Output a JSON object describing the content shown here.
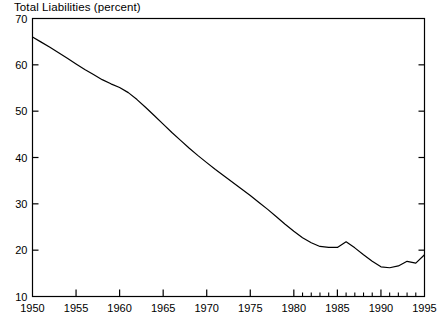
{
  "chart_data": {
    "type": "line",
    "title": "Total Liabilities (percent)",
    "xlabel": "",
    "ylabel": "",
    "xlim": [
      1950,
      1995
    ],
    "ylim": [
      10,
      70
    ],
    "grid": false,
    "legend": null,
    "yticks": [
      10,
      20,
      30,
      40,
      50,
      60,
      70
    ],
    "ytick_labels": [
      "10",
      "20",
      "30",
      "40",
      "50",
      "60",
      "70"
    ],
    "xticks": [
      1950,
      1955,
      1960,
      1965,
      1970,
      1975,
      1980,
      1985,
      1990,
      1995
    ],
    "xtick_labels": [
      "1950",
      "1955",
      "1960",
      "1965",
      "1970",
      "1975",
      "1980",
      "1985",
      "1990",
      "1995"
    ],
    "minor_xticks": [
      1981,
      1982,
      1983,
      1984,
      1986,
      1987,
      1988,
      1989,
      1991,
      1992,
      1993,
      1994
    ],
    "minor_ytick_side": "right",
    "line_color": "#000000",
    "line_width": 1.2,
    "series": [
      {
        "name": "Total Liabilities",
        "x": [
          1950,
          1951,
          1952,
          1953,
          1954,
          1955,
          1956,
          1957,
          1958,
          1959,
          1960,
          1961,
          1962,
          1963,
          1964,
          1965,
          1966,
          1967,
          1968,
          1969,
          1970,
          1971,
          1972,
          1973,
          1974,
          1975,
          1976,
          1977,
          1978,
          1979,
          1980,
          1981,
          1982,
          1983,
          1984,
          1985,
          1986,
          1987,
          1988,
          1989,
          1990,
          1991,
          1992,
          1993,
          1994,
          1995
        ],
        "values": [
          66.0,
          64.9,
          63.8,
          62.6,
          61.4,
          60.2,
          59.0,
          57.9,
          56.8,
          55.9,
          55.1,
          54.0,
          52.5,
          50.8,
          49.0,
          47.2,
          45.4,
          43.7,
          42.0,
          40.4,
          38.9,
          37.4,
          36.0,
          34.6,
          33.2,
          31.8,
          30.3,
          28.8,
          27.2,
          25.6,
          24.1,
          22.7,
          21.6,
          20.8,
          20.6,
          20.6,
          21.8,
          20.5,
          19.0,
          17.6,
          16.4,
          16.2,
          16.6,
          17.6,
          17.2,
          19.0
        ]
      }
    ]
  }
}
